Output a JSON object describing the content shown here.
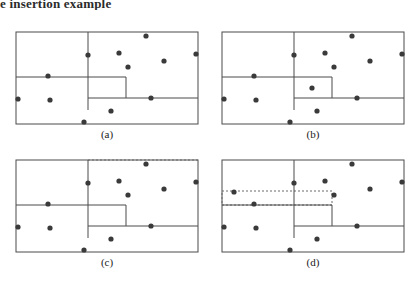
{
  "figure": {
    "caption_top": "e insertion example",
    "stroke_color": "#4a4a4a",
    "point_color": "#3a3a3a",
    "dash_color": "#6b6b6b",
    "background": "#ffffff",
    "point_radius": 2.6,
    "box_width": 182,
    "box_height": 92
  },
  "panels": [
    {
      "id": "a",
      "label": "(a)",
      "x": 14,
      "y": 30,
      "outer": {
        "x": 0,
        "y": 0,
        "w": 182,
        "h": 92,
        "style": "solid"
      },
      "lines": [
        {
          "name": "vertical-split-upper",
          "x1": 72,
          "y1": 0,
          "x2": 72,
          "y2": 78,
          "style": "solid"
        },
        {
          "name": "horizontal-split-left",
          "x1": 0,
          "y1": 45,
          "x2": 110,
          "y2": 45,
          "style": "solid"
        },
        {
          "name": "vertical-split-inner",
          "x1": 110,
          "y1": 45,
          "x2": 110,
          "y2": 66,
          "style": "solid"
        },
        {
          "name": "horizontal-split-right",
          "x1": 72,
          "y1": 66,
          "x2": 182,
          "y2": 66,
          "style": "solid"
        }
      ],
      "points": [
        {
          "x": 2,
          "y": 67
        },
        {
          "x": 34,
          "y": 68
        },
        {
          "x": 32,
          "y": 44
        },
        {
          "x": 68,
          "y": 90
        },
        {
          "x": 72,
          "y": 23
        },
        {
          "x": 95,
          "y": 79
        },
        {
          "x": 103,
          "y": 21
        },
        {
          "x": 112,
          "y": 35
        },
        {
          "x": 130,
          "y": 4
        },
        {
          "x": 135,
          "y": 66
        },
        {
          "x": 148,
          "y": 29
        },
        {
          "x": 180,
          "y": 22
        }
      ]
    },
    {
      "id": "b",
      "label": "(b)",
      "x": 220,
      "y": 30,
      "outer": {
        "x": 0,
        "y": 0,
        "w": 182,
        "h": 92,
        "style": "solid"
      },
      "lines": [
        {
          "name": "vertical-split-upper",
          "x1": 72,
          "y1": 0,
          "x2": 72,
          "y2": 78,
          "style": "solid"
        },
        {
          "name": "horizontal-split-left",
          "x1": 0,
          "y1": 45,
          "x2": 110,
          "y2": 45,
          "style": "solid"
        },
        {
          "name": "vertical-split-inner",
          "x1": 110,
          "y1": 45,
          "x2": 110,
          "y2": 66,
          "style": "solid"
        },
        {
          "name": "horizontal-split-right",
          "x1": 72,
          "y1": 66,
          "x2": 182,
          "y2": 66,
          "style": "solid"
        }
      ],
      "points": [
        {
          "x": 2,
          "y": 67
        },
        {
          "x": 34,
          "y": 68
        },
        {
          "x": 32,
          "y": 44
        },
        {
          "x": 68,
          "y": 90
        },
        {
          "x": 72,
          "y": 23
        },
        {
          "x": 90,
          "y": 56
        },
        {
          "x": 95,
          "y": 79
        },
        {
          "x": 103,
          "y": 21
        },
        {
          "x": 112,
          "y": 35
        },
        {
          "x": 130,
          "y": 4
        },
        {
          "x": 135,
          "y": 66
        },
        {
          "x": 148,
          "y": 29
        },
        {
          "x": 180,
          "y": 22
        }
      ]
    },
    {
      "id": "c",
      "label": "(c)",
      "x": 14,
      "y": 158,
      "outer": {
        "x": 0,
        "y": 0,
        "w": 182,
        "h": 92,
        "style": "solid"
      },
      "dashed_top": {
        "name": "dashed-top-extension",
        "x1": 72,
        "y1": 0,
        "x2": 182,
        "y2": 0
      },
      "lines": [
        {
          "name": "vertical-split-upper",
          "x1": 72,
          "y1": 0,
          "x2": 72,
          "y2": 78,
          "style": "solid"
        },
        {
          "name": "horizontal-split-left",
          "x1": 0,
          "y1": 45,
          "x2": 110,
          "y2": 45,
          "style": "solid"
        },
        {
          "name": "vertical-split-inner",
          "x1": 110,
          "y1": 45,
          "x2": 110,
          "y2": 66,
          "style": "solid"
        },
        {
          "name": "horizontal-split-right",
          "x1": 72,
          "y1": 66,
          "x2": 182,
          "y2": 66,
          "style": "solid"
        }
      ],
      "points": [
        {
          "x": 2,
          "y": 67
        },
        {
          "x": 34,
          "y": 68
        },
        {
          "x": 32,
          "y": 44
        },
        {
          "x": 68,
          "y": 90
        },
        {
          "x": 72,
          "y": 23
        },
        {
          "x": 95,
          "y": 79
        },
        {
          "x": 103,
          "y": 21
        },
        {
          "x": 112,
          "y": 35
        },
        {
          "x": 130,
          "y": 4
        },
        {
          "x": 135,
          "y": 66
        },
        {
          "x": 148,
          "y": 29
        },
        {
          "x": 180,
          "y": 22
        }
      ]
    },
    {
      "id": "d",
      "label": "(d)",
      "x": 220,
      "y": 158,
      "outer": {
        "x": 0,
        "y": 0,
        "w": 182,
        "h": 92,
        "style": "solid"
      },
      "dashed_box": {
        "name": "dashed-enlarged-rectangle",
        "x": 0,
        "y": 31,
        "w": 110,
        "h": 14
      },
      "lines": [
        {
          "name": "vertical-split-upper",
          "x1": 72,
          "y1": 0,
          "x2": 72,
          "y2": 78,
          "style": "solid"
        },
        {
          "name": "horizontal-split-left",
          "x1": 0,
          "y1": 45,
          "x2": 110,
          "y2": 45,
          "style": "solid"
        },
        {
          "name": "vertical-split-inner",
          "x1": 110,
          "y1": 45,
          "x2": 110,
          "y2": 66,
          "style": "solid"
        },
        {
          "name": "horizontal-split-right",
          "x1": 72,
          "y1": 66,
          "x2": 182,
          "y2": 66,
          "style": "solid"
        }
      ],
      "points": [
        {
          "x": 2,
          "y": 67
        },
        {
          "x": 12,
          "y": 32
        },
        {
          "x": 34,
          "y": 68
        },
        {
          "x": 32,
          "y": 44
        },
        {
          "x": 68,
          "y": 90
        },
        {
          "x": 72,
          "y": 23
        },
        {
          "x": 95,
          "y": 79
        },
        {
          "x": 103,
          "y": 21
        },
        {
          "x": 112,
          "y": 35
        },
        {
          "x": 130,
          "y": 4
        },
        {
          "x": 135,
          "y": 66
        },
        {
          "x": 148,
          "y": 29
        },
        {
          "x": 180,
          "y": 22
        }
      ]
    }
  ]
}
